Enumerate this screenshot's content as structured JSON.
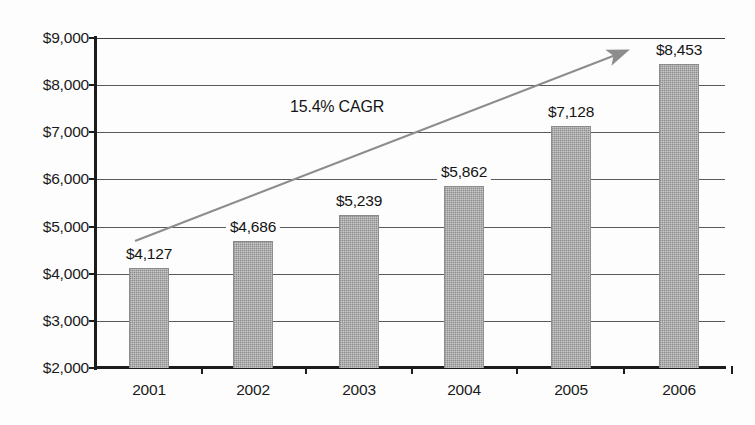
{
  "chart_data": {
    "type": "bar",
    "title": "",
    "subtitle": "",
    "xlabel": "",
    "ylabel": "",
    "categories": [
      "2001",
      "2002",
      "2003",
      "2004",
      "2005",
      "2006"
    ],
    "values": [
      4127,
      4686,
      5239,
      5862,
      7128,
      8453
    ],
    "value_labels": [
      "$4,127",
      "$4,686",
      "$5,239",
      "$5,862",
      "$7,128",
      "$8,453"
    ],
    "ylim": [
      2000,
      9000
    ],
    "ytick_values": [
      2000,
      3000,
      4000,
      5000,
      6000,
      7000,
      8000,
      9000
    ],
    "ytick_labels": [
      "$2,000",
      "$3,000",
      "$4,000",
      "$5,000",
      "$6,000",
      "$7,000",
      "$8,000",
      "$9,000"
    ],
    "grid": true,
    "legend": null,
    "series": [
      {
        "name": "Revenue",
        "values": [
          4127,
          4686,
          5239,
          5862,
          7128,
          8453
        ],
        "color": "#9d9d9d"
      }
    ],
    "annotations": [
      {
        "name": "cagr-annotation",
        "text": "15.4% CAGR",
        "type": "text"
      },
      {
        "name": "growth-trend-arrow",
        "type": "arrow",
        "color": "#8d8d8d",
        "from_value": 4620,
        "to_value": 8800
      }
    ]
  },
  "colors": {
    "bar_fill": "#9d9d9d",
    "axis": "#1c1c1c",
    "gridline": "#5a5a5a",
    "arrow": "#8d8d8d",
    "text": "#1a1a1a",
    "background": "#fdfdfd"
  }
}
